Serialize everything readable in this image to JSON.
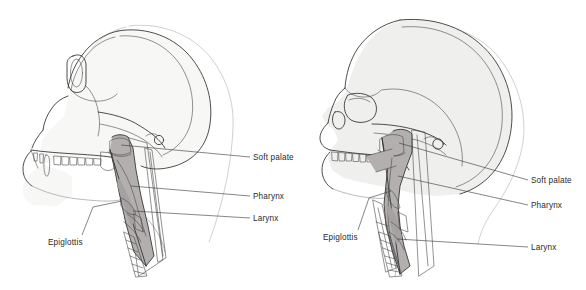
{
  "figure": {
    "background_color": "#ffffff",
    "line_color": "#2e2e2e",
    "tract_shade_color": "#b3afaf",
    "bone_shade_color": "#f2f2f1",
    "label_color": "#2b2b2b"
  },
  "panels": [
    {
      "id": "chimpanzee",
      "name": "chimpanzee-panel",
      "subject": "chimpanzee skull and vocal tract",
      "labels": [
        {
          "id": "soft-palate",
          "text": "Soft palate",
          "x": 253,
          "y": 160
        },
        {
          "id": "pharynx",
          "text": "Pharynx",
          "x": 253,
          "y": 199
        },
        {
          "id": "larynx",
          "text": "Larynx",
          "x": 253,
          "y": 221
        },
        {
          "id": "epiglottis",
          "text": "Epiglottis",
          "x": 48,
          "y": 245
        }
      ]
    },
    {
      "id": "human",
      "name": "human-panel",
      "subject": "human skull and vocal tract",
      "labels": [
        {
          "id": "soft-palate",
          "text": "Soft palate",
          "x": 531,
          "y": 183
        },
        {
          "id": "pharynx",
          "text": "Pharynx",
          "x": 531,
          "y": 208
        },
        {
          "id": "larynx",
          "text": "Larynx",
          "x": 531,
          "y": 250
        },
        {
          "id": "epiglottis",
          "text": "Epiglottis",
          "x": 323,
          "y": 240
        }
      ]
    }
  ],
  "structures": [
    {
      "id": "soft-palate",
      "label": "Soft palate"
    },
    {
      "id": "pharynx",
      "label": "Pharynx"
    },
    {
      "id": "larynx",
      "label": "Larynx"
    },
    {
      "id": "epiglottis",
      "label": "Epiglottis"
    }
  ]
}
